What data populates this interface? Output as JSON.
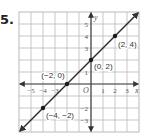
{
  "problem": {
    "number": "5."
  },
  "chart_data": {
    "type": "line",
    "title": "",
    "xlabel": "x",
    "ylabel": "y",
    "origin_label": "O",
    "xlim": [
      -6,
      4
    ],
    "ylim": [
      -4,
      6
    ],
    "grid": true,
    "x_ticks": [
      "-5",
      "-4",
      "-3",
      "1",
      "2",
      "3"
    ],
    "y_ticks": [
      "5",
      "4",
      "3",
      "1",
      "-2",
      "-3"
    ],
    "series": [
      {
        "name": "y = x + 2",
        "x": [
          -6,
          4
        ],
        "y": [
          -4,
          6
        ],
        "arrows": "both ends"
      }
    ],
    "points": [
      {
        "x": -4,
        "y": -2,
        "label": "(−4, −2)"
      },
      {
        "x": -2,
        "y": 0,
        "label": "(−2, 0)"
      },
      {
        "x": 0,
        "y": 2,
        "label": "(0, 2)"
      },
      {
        "x": 2,
        "y": 4,
        "label": "(2, 4)"
      }
    ],
    "colors": {
      "grid": "#b9b9b9",
      "axes": "#444444",
      "line": "#2a2a2a",
      "points": "#1a1a1a"
    }
  }
}
